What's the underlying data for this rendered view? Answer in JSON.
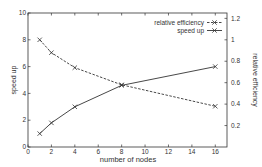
{
  "chart_data": {
    "type": "line",
    "title": "",
    "xlabel": "number of nodes",
    "ylabel": "speed up",
    "y2label": "relative efficiency",
    "xlim": [
      0,
      17
    ],
    "ylim": [
      0,
      10
    ],
    "y2lim": [
      0,
      1.25
    ],
    "x_ticks": [
      0,
      2,
      4,
      6,
      8,
      10,
      12,
      14,
      16
    ],
    "y_ticks": [
      0,
      2,
      4,
      6,
      8,
      10
    ],
    "y2_ticks": [
      0.2,
      0.4,
      0.6,
      0.8,
      1,
      1.2
    ],
    "grid": false,
    "legend_position": "upper right",
    "x": [
      1,
      2,
      4,
      8,
      16
    ],
    "series": [
      {
        "name": "relative efficiency",
        "axis": "right",
        "style": "dashed",
        "marker": "x",
        "values": [
          1.0,
          0.88,
          0.74,
          0.58,
          0.38
        ]
      },
      {
        "name": "speed up",
        "axis": "left",
        "style": "solid",
        "marker": "x",
        "values": [
          1.0,
          1.8,
          3.0,
          4.6,
          6.0
        ]
      }
    ]
  },
  "legend": {
    "items": [
      {
        "label": "relative efficiency"
      },
      {
        "label": "speed up"
      }
    ]
  },
  "colors": {
    "line": "#333333",
    "axis": "#333333",
    "text": "#333333",
    "background": "#ffffff"
  }
}
